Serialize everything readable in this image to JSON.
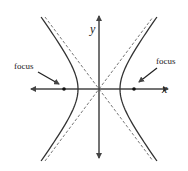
{
  "diagram": {
    "type": "hyperbola",
    "axes": {
      "x_label": "x",
      "y_label": "y"
    },
    "labels": {
      "left_focus": "focus",
      "right_focus": "focus"
    },
    "geometry": {
      "origin_px": [
        99,
        89
      ],
      "a_px": 21,
      "b_px": 28,
      "c_px": 35
    },
    "colors": {
      "curve": "#333333",
      "axis": "#444444",
      "asymptote": "#555555",
      "text": "#222222",
      "background": "#ffffff"
    }
  }
}
